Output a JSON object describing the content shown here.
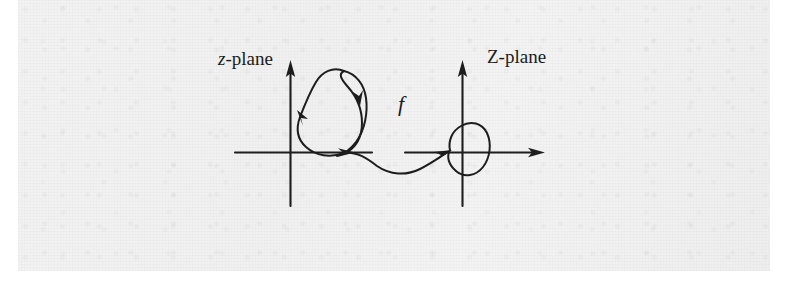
{
  "figure": {
    "background_color": "#f1f1f1",
    "ink_color": "#1b1b1b",
    "width": 795,
    "height": 283
  },
  "labels": {
    "z_plane": {
      "italic_part": "z",
      "rest": "-plane"
    },
    "Z_plane": "Z-plane",
    "map": "f"
  },
  "diagram_data": {
    "type": "diagram",
    "panels": [
      {
        "name": "z-plane",
        "label": "z-plane",
        "origin": {
          "x": 290,
          "y": 152
        },
        "axes": {
          "horizontal": {
            "x1": 235,
            "y1": 152,
            "x2": 370,
            "y2": 152,
            "arrow": "none"
          },
          "vertical": {
            "x1": 290,
            "y1": 205,
            "x2": 290,
            "y2": 62,
            "arrow": "up"
          }
        },
        "contour": {
          "kind": "closed-curve-with-self-intersection",
          "description": "large closed loop in the first quadrant crossing itself near the right, forming a small inner loop",
          "direction_arrows": [
            {
              "x": 301,
              "y": 118,
              "heading": "down-left"
            },
            {
              "x": 346,
              "y": 152,
              "heading": "right"
            },
            {
              "x": 351,
              "y": 100,
              "heading": "down"
            }
          ]
        }
      },
      {
        "name": "Z-plane",
        "label": "Z-plane",
        "origin": {
          "x": 462,
          "y": 152
        },
        "axes": {
          "horizontal": {
            "x1": 405,
            "y1": 152,
            "x2": 543,
            "y2": 152,
            "arrow": "right"
          },
          "vertical": {
            "x1": 462,
            "y1": 205,
            "x2": 462,
            "y2": 62,
            "arrow": "up"
          }
        },
        "contour": {
          "kind": "small-closed-loop",
          "description": "small rounded closed loop straddling the origin with a cusp at its left side",
          "direction_arrows": [
            {
              "x": 450,
              "y": 150,
              "heading": "right"
            }
          ]
        }
      }
    ],
    "connector": {
      "label": "f",
      "kind": "curve",
      "from": {
        "x": 346,
        "y": 152
      },
      "to": {
        "x": 450,
        "y": 151
      },
      "description": "dipping curve carrying the z-plane contour point to the Z-plane contour, terminating in an arrowhead"
    }
  }
}
